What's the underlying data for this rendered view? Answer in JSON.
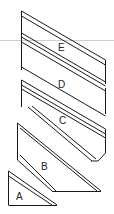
{
  "diagram": {
    "type": "stacked-panels",
    "colors": {
      "line": "#1a1a1a",
      "guide": "#cfcfcf",
      "background": "#ffffff"
    },
    "panels": [
      {
        "id": "E",
        "label": "E"
      },
      {
        "id": "D",
        "label": "D"
      },
      {
        "id": "C",
        "label": "C"
      },
      {
        "id": "B",
        "label": "B"
      },
      {
        "id": "A",
        "label": "A"
      }
    ]
  }
}
